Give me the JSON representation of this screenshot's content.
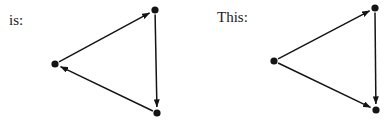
{
  "labels": {
    "left": "is:",
    "right": "This:"
  },
  "colors": {
    "ink": "#141414",
    "background": "#ffffff"
  },
  "graphs": [
    {
      "name": "left-graph",
      "nodes": [
        {
          "id": "A",
          "x": 55,
          "y": 64
        },
        {
          "id": "B",
          "x": 155,
          "y": 10
        },
        {
          "id": "C",
          "x": 157,
          "y": 113
        }
      ],
      "edges": [
        {
          "from": "A",
          "to": "B"
        },
        {
          "from": "B",
          "to": "C"
        },
        {
          "from": "C",
          "to": "A"
        }
      ]
    },
    {
      "name": "right-graph",
      "nodes": [
        {
          "id": "A",
          "x": 274,
          "y": 61
        },
        {
          "id": "B",
          "x": 375,
          "y": 8
        },
        {
          "id": "C",
          "x": 376,
          "y": 110
        }
      ],
      "edges": [
        {
          "from": "A",
          "to": "B"
        },
        {
          "from": "B",
          "to": "C"
        },
        {
          "from": "A",
          "to": "C"
        }
      ]
    }
  ]
}
